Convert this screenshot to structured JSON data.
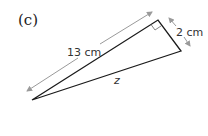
{
  "part_label": "(c)",
  "triangle": {
    "hypotenuse_label": "13 cm",
    "short_side_label": "2 cm",
    "unknown_label": "z",
    "right_angle": true
  },
  "colors": {
    "triangle_stroke": "#1a1a1a",
    "arrow_stroke": "#9a9a9a",
    "text": "#333333"
  }
}
